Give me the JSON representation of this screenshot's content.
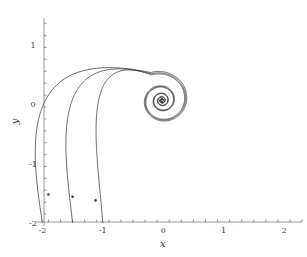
{
  "chart_data": {
    "type": "line",
    "title": "",
    "xlabel": "x",
    "ylabel": "y",
    "xlim": [
      -2.1,
      2.4
    ],
    "ylim": [
      -2.05,
      1.55
    ],
    "grid": false,
    "legend": null,
    "axes_style": "spines-at-origin-left-bottom",
    "xticks": [
      -2,
      -1,
      0,
      1,
      2
    ],
    "xticklabels": [
      "-2",
      "-1",
      "0",
      "1",
      "2"
    ],
    "yticks": [
      -2,
      -1,
      0,
      1
    ],
    "yticklabels": [
      "-2",
      "-1",
      "0",
      "1"
    ],
    "minor_tick_step": 0.2,
    "series": [
      {
        "name": "curve-1",
        "start_point": [
          -2.0,
          -2.0
        ],
        "marker_point": [
          -1.9,
          -1.52
        ],
        "spiral_center": [
          -0.02,
          0.06
        ],
        "color": "#3a3a3a"
      },
      {
        "name": "curve-2",
        "start_point": [
          -1.5,
          -2.0
        ],
        "marker_point": [
          -1.5,
          -1.56
        ],
        "spiral_center": [
          -0.02,
          0.06
        ],
        "color": "#3a3a3a"
      },
      {
        "name": "curve-3",
        "start_point": [
          -1.0,
          -2.0
        ],
        "marker_point": [
          -1.12,
          -1.62
        ],
        "spiral_center": [
          -0.02,
          0.06
        ],
        "color": "#3a3a3a"
      }
    ]
  },
  "figure": {
    "background_color": "#ffffff",
    "axis_color": "#6b6b6b",
    "curve_color": "#3a3a3a"
  }
}
